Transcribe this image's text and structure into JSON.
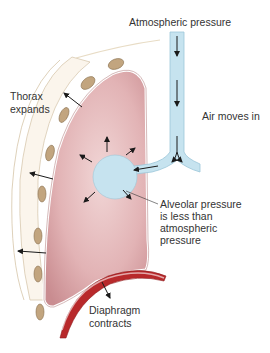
{
  "diagram": {
    "labels": {
      "atmospheric_pressure": "Atmospheric pressure",
      "thorax_expands_line1": "Thorax",
      "thorax_expands_line2": "expands",
      "air_moves_in": "Air moves in",
      "alveolar_line1": "Alveolar pressure",
      "alveolar_line2": "is less than",
      "alveolar_line3": "atmospheric",
      "alveolar_line4": "pressure",
      "diaphragm_line1": "Diaphragm",
      "diaphragm_line2": "contracts"
    },
    "colors": {
      "lung_fill": "#d9a0a3",
      "lung_light": "#f0d2d2",
      "airway": "#c6e3ef",
      "airway_edge": "#9cc7d9",
      "rib": "#c2a57f",
      "rib_edge": "#8a7150",
      "pleura": "#fbf5ec",
      "diaphragm": "#b8292b",
      "arrow": "#1a1a1a",
      "text": "#333333"
    },
    "components": [
      "trachea",
      "bronchus",
      "alveolus",
      "lung",
      "rib-cage",
      "diaphragm"
    ]
  }
}
